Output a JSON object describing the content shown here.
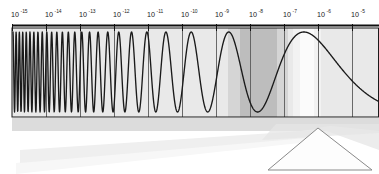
{
  "figure": {
    "background_color": "#ffffff",
    "plot": {
      "left": 12,
      "right": 379,
      "top": 28,
      "bottom": 117,
      "fill_color": "#e9e9e9",
      "border_color": "#1a1a1a",
      "gridline_color": "#5a5a5a"
    },
    "axis": {
      "name": "wavelength-axis",
      "orientation": "horizontal",
      "position": "top",
      "line_color": "#111111",
      "line_y": 25,
      "tick_length": 6,
      "base": "10",
      "ticks": [
        {
          "label": "10",
          "exponent": "-15",
          "x": 12
        },
        {
          "label": "10",
          "exponent": "-14",
          "x": 46
        },
        {
          "label": "10",
          "exponent": "-13",
          "x": 80
        },
        {
          "label": "10",
          "exponent": "-12",
          "x": 114
        },
        {
          "label": "10",
          "exponent": "-11",
          "x": 148
        },
        {
          "label": "10",
          "exponent": "-10",
          "x": 182
        },
        {
          "label": "10",
          "exponent": "-9",
          "x": 216
        },
        {
          "label": "10",
          "exponent": "-8",
          "x": 250
        },
        {
          "label": "10",
          "exponent": "-7",
          "x": 284
        },
        {
          "label": "10",
          "exponent": "-6",
          "x": 318
        },
        {
          "label": "10",
          "exponent": "-5",
          "x": 352
        }
      ]
    },
    "bands": [
      {
        "name": "visible-band-shaded",
        "x": 240,
        "width": 37,
        "color": "#bdbdbd"
      },
      {
        "name": "visible-band-soft-left",
        "x": 228,
        "width": 12,
        "color": "#d5d5d5"
      },
      {
        "name": "visible-band-soft-right",
        "x": 277,
        "width": 11,
        "color": "#d5d5d5"
      },
      {
        "name": "bright-beam-band",
        "x": 300,
        "width": 14,
        "color": "#fbfbfb"
      },
      {
        "name": "bright-beam-halo-left",
        "x": 293,
        "width": 7,
        "color": "#f2f2f2"
      },
      {
        "name": "bright-beam-halo-right",
        "x": 314,
        "width": 7,
        "color": "#f2f2f2"
      }
    ],
    "wave": {
      "name": "electromagnetic-wave",
      "stroke_color": "#1a1a1a",
      "stroke_width": 1.35,
      "center_y": 72,
      "amplitude": 40,
      "description": "sinusoid whose wavelength grows logarithmically from left to right",
      "start_x": 13,
      "end_x": 379,
      "cycles_left_to_right": "chirped: ~11 tight cycles before x=60, widening to a single broad arch past x=200"
    },
    "ground": {
      "name": "ground-shadow-strip",
      "y": 118,
      "height": 14,
      "color": "#d8d8d8"
    },
    "beam": {
      "name": "light-beam",
      "color": "#f4f4f4",
      "edge_color": "#e2e2e2",
      "description": "pale wedge of light travelling down-right toward the prism apex"
    },
    "prism": {
      "name": "dispersing-prism",
      "shape": "triangle",
      "apex_x": 318,
      "apex_y": 128,
      "base_left_x": 268,
      "base_right_x": 372,
      "base_y": 170,
      "stroke_color": "#8a8a8a",
      "fill_color": "#fdfdfd"
    }
  }
}
